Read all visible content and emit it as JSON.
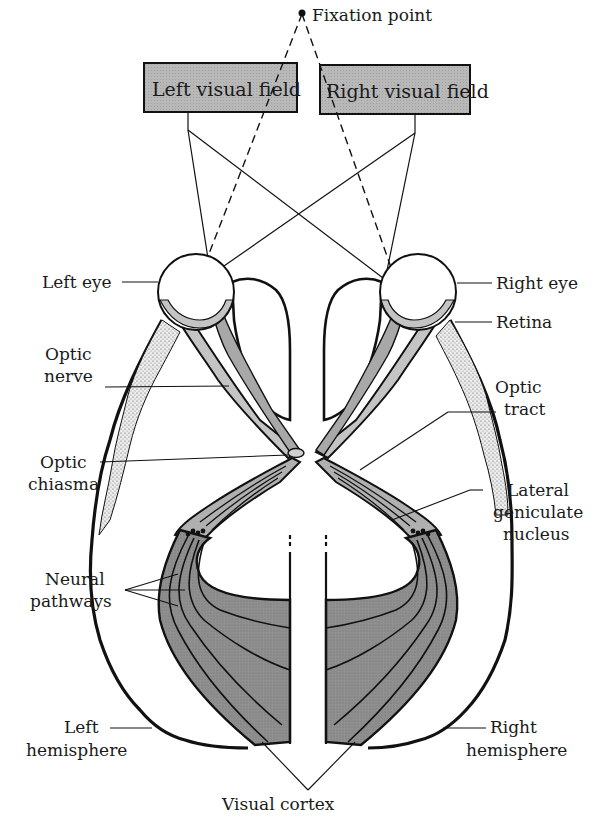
{
  "fixation": {
    "label": "Fixation point"
  },
  "fields": {
    "left": {
      "label": "Left visual field"
    },
    "right": {
      "label": "Right visual field"
    }
  },
  "labels": {
    "left_eye": "Left eye",
    "right_eye": "Right eye",
    "retina": "Retina",
    "optic_nerve_1": "Optic",
    "optic_nerve_2": "nerve",
    "optic_tract_1": "Optic",
    "optic_tract_2": "tract",
    "optic_chiasma_1": "Optic",
    "optic_chiasma_2": "chiasma",
    "lgn_1": "Lateral",
    "lgn_2": "geniculate",
    "lgn_3": "nucleus",
    "neural_pathways_1": "Neural",
    "neural_pathways_2": "pathways",
    "left_hemisphere_1": "Left",
    "left_hemisphere_2": "hemisphere",
    "right_hemisphere_1": "Right",
    "right_hemisphere_2": "hemisphere",
    "visual_cortex": "Visual cortex"
  },
  "colors": {
    "field_box": "#b5b5b5",
    "nerve_light": "#c8c8c8",
    "nerve_dark": "#a0a0a0",
    "cortex": "#8e8e8e",
    "stipple": "#e6e6e6",
    "ink": "#111111"
  }
}
